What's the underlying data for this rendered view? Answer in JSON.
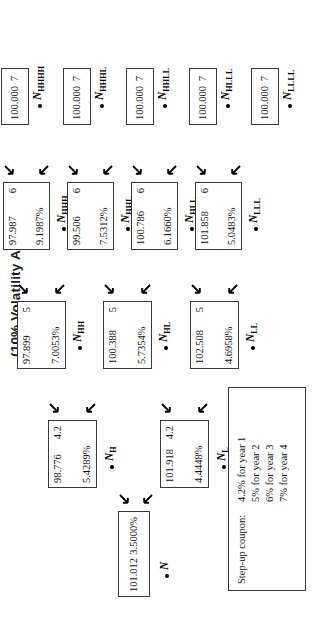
{
  "title": "(10% Volatility Assumed)",
  "tree": {
    "columns": [
      {
        "id": "year0",
        "nodes": [
          {
            "label_main": "N",
            "label_sub": "",
            "value": "101.012",
            "coupon": "",
            "rate": "3.5000%",
            "kind": "root"
          }
        ]
      },
      {
        "id": "year1",
        "nodes": [
          {
            "label_main": "N",
            "label_sub": "H",
            "value": "98.776",
            "coupon": "4.2",
            "rate": "5.4289%",
            "kind": "mid"
          },
          {
            "label_main": "N",
            "label_sub": "L",
            "value": "101.918",
            "coupon": "4.2",
            "rate": "4.4448%",
            "kind": "mid"
          }
        ]
      },
      {
        "id": "year2",
        "nodes": [
          {
            "label_main": "N",
            "label_sub": "HH",
            "value": "97.899",
            "coupon": "5",
            "rate": "7.0053%",
            "kind": "mid"
          },
          {
            "label_main": "N",
            "label_sub": "HL",
            "value": "100.388",
            "coupon": "5",
            "rate": "5.7354%",
            "kind": "mid"
          },
          {
            "label_main": "N",
            "label_sub": "LL",
            "value": "102.508",
            "coupon": "5",
            "rate": "4.6958%",
            "kind": "mid"
          }
        ]
      },
      {
        "id": "year3",
        "nodes": [
          {
            "label_main": "N",
            "label_sub": "HHH",
            "value": "97.987",
            "coupon": "6",
            "rate": "9.1987%",
            "kind": "mid"
          },
          {
            "label_main": "N",
            "label_sub": "HHL",
            "value": "99.506",
            "coupon": "6",
            "rate": "7.5312%",
            "kind": "mid"
          },
          {
            "label_main": "N",
            "label_sub": "HLL",
            "value": "100.786",
            "coupon": "6",
            "rate": "6.1660%",
            "kind": "mid"
          },
          {
            "label_main": "N",
            "label_sub": "LLL",
            "value": "101.858",
            "coupon": "6",
            "rate": "5.0483%",
            "kind": "mid"
          }
        ]
      },
      {
        "id": "year4",
        "nodes": [
          {
            "label_main": "N",
            "label_sub": "HHHH",
            "value": "100.000",
            "coupon": "7",
            "rate": "",
            "kind": "term"
          },
          {
            "label_main": "N",
            "label_sub": "HHHL",
            "value": "100.000",
            "coupon": "7",
            "rate": "",
            "kind": "term"
          },
          {
            "label_main": "N",
            "label_sub": "HHLL",
            "value": "100.000",
            "coupon": "7",
            "rate": "",
            "kind": "term"
          },
          {
            "label_main": "N",
            "label_sub": "HLLL",
            "value": "100.000",
            "coupon": "7",
            "rate": "",
            "kind": "term"
          },
          {
            "label_main": "N",
            "label_sub": "LLLL",
            "value": "100.000",
            "coupon": "7",
            "rate": "",
            "kind": "term"
          }
        ]
      }
    ]
  },
  "legend": {
    "title": "Step-up coupon:",
    "lines": [
      "4.2% for year 1",
      "5% for year 2",
      "6% for year 3",
      "7% for year 4"
    ]
  }
}
